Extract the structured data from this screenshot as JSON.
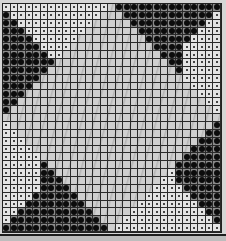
{
  "board": {
    "columns": 29,
    "rows": 29,
    "legend": {
      "L": "light-square-with-dot",
      "D": "dark-square-with-filled-circle",
      "P": "plain-center-diamond"
    },
    "colors": {
      "grid_line": "#2a2a2a",
      "light_cell": "#e4e4e4",
      "dark_cell": "#8a8a8a",
      "marker": "#0c0c0c",
      "center": "#cfcfcf"
    },
    "cells": [
      "LLLLLLLLLLLLLLPDDDDDDDDDDDDDD",
      "DLLLLLLLLLLLLPPPDDDDDDDDDDDDL",
      "DDLLLLLLLLLLPPPPPDDDDDDDDDDLL",
      "DDDLLLLLLLLPPPPPPPDDDDDDDDLLL",
      "DDDDLLLLLLPPPPPPPPPDDDDDDLLLL",
      "DDDDDLLLLPPPPPPPPPPPDDDDLLLLL",
      "DDDDDDLLPPPPPPPPPPPPPDDDLLLLL",
      "DDDDDDDPPPPPPPPPPPPPPPDDLLLLL",
      "DDDDDDPPPPPPPPPPPPPPPPPDLLLLL",
      "DDDDDPPPPPPPPPPPPPPPPPPPLLLLL",
      "DDDDPPPPPPPPPPPPPPPPPPPPPLLLL",
      "DDDPPPPPPPPPPPPPPPPPPPPPPPLLL",
      "DDPPPPPPPPPPPPPPPPPPPPPPPPPLL",
      "DPPPPPPPPPPPPPPPPPPPPPPPPPPPL",
      "PPPPPPPPPPPPPPPPPPPPPPPPPPPPP",
      "LPPPPPPPPPPPPPPPPPPPPPPPPPPPD",
      "LLPPPPPPPPPPPPPPPPPPPPPPPPPDD",
      "LLLPPPPPPPPPPPPPPPPPPPPPPPDDD",
      "LLLLPPPPPPPPPPPPPPPPPPPPPDDDD",
      "LLLLLPPPPPPPPPPPPPPPPPPPDDDDD",
      "LLLLLDPPPPPPPPPPPPPPPPPDDDDDD",
      "LLLLLDDPPPPPPPPPPPPPPPLDDDDDD",
      "LLLLLDDDPPPPPPPPPPPPPLLDDDDDD",
      "LLLLLDDDDPPPPPPPPPPPLLLLDDDDD",
      "LLLLDDDDDDPPPPPPPPPLLLLLLDDDD",
      "LLLDDDDDDDDPPPPPPPLLLLLLLLDDD",
      "LLDDDDDDDDDDPPPPPLLLLLLLLLLDD",
      "LDDDDDDDDDDDDPPPLLLLLLLLLLLLD",
      "DDDDDDDDDDDDDDPLLLLLLLLLLLLLL"
    ]
  }
}
